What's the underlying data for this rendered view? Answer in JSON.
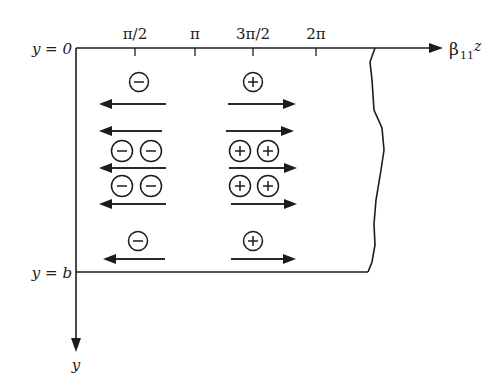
{
  "diagram": {
    "axes": {
      "horizontal_label": "β",
      "horizontal_sub": "11",
      "horizontal_var": "z",
      "vertical_label": "y",
      "top_label": "y = 0",
      "bottom_label": "y = b"
    },
    "ticks": [
      {
        "label": "π/2",
        "x": 135
      },
      {
        "label": "π",
        "x": 195
      },
      {
        "label": "3π/2",
        "x": 253
      },
      {
        "label": "2π",
        "x": 316
      }
    ],
    "charge_regions": [
      {
        "sign": "-",
        "direction": "left",
        "column_x": 135
      },
      {
        "sign": "+",
        "direction": "right",
        "column_x": 253
      }
    ],
    "colors": {
      "ink": "#1c1c1c",
      "background": "#ffffff"
    }
  }
}
